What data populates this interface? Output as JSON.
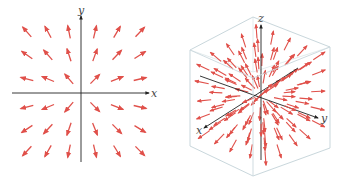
{
  "figure": {
    "colors": {
      "arrow": "#e0504a",
      "axis": "#222222",
      "box_edge": "#c9d7dc",
      "box_hidden_edge": "#dde6e9",
      "background": "#ffffff"
    }
  },
  "left_plot": {
    "type": "2d-vector-field",
    "axis_labels": {
      "x": "x",
      "y": "y"
    },
    "origin": [
      81,
      93
    ],
    "x_axis": {
      "from": [
        12,
        93
      ],
      "to": [
        149,
        93
      ]
    },
    "y_axis": {
      "from": [
        81,
        162
      ],
      "to": [
        81,
        16
      ]
    },
    "grid_x": [
      27,
      48,
      69,
      95,
      117,
      140
    ],
    "grid_y": [
      32,
      55,
      79,
      107,
      129,
      151
    ],
    "arrow_length": 13
  },
  "right_plot": {
    "type": "3d-vector-field",
    "axis_labels": {
      "x": "x",
      "y": "y",
      "z": "z"
    },
    "origin": [
      91,
      95
    ],
    "z_axis": {
      "from": [
        91,
        160
      ],
      "to": [
        91,
        25
      ]
    },
    "x_axis": {
      "from": [
        128,
        68
      ],
      "to": [
        34,
        128
      ]
    },
    "y_axis": {
      "from": [
        30,
        76
      ],
      "to": [
        148,
        118
      ]
    },
    "cube": {
      "outer": [
        [
          83,
          17
        ],
        [
          160,
          47
        ],
        [
          160,
          148
        ],
        [
          83,
          176
        ],
        [
          20,
          146
        ],
        [
          20,
          50
        ]
      ],
      "inner_edges": [
        [
          [
            83,
            17
          ],
          [
            83,
            72
          ]
        ],
        [
          [
            83,
            72
          ],
          [
            160,
            47
          ]
        ],
        [
          [
            83,
            72
          ],
          [
            20,
            50
          ]
        ]
      ],
      "front_edges": [
        [
          [
            20,
            50
          ],
          [
            83,
            78
          ]
        ],
        [
          [
            83,
            78
          ],
          [
            160,
            47
          ]
        ],
        [
          [
            83,
            78
          ],
          [
            83,
            176
          ]
        ]
      ]
    },
    "arrow_rays": 40
  }
}
